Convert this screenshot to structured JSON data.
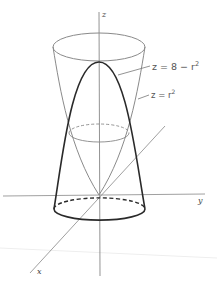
{
  "diagram": {
    "type": "3d-surface-intersection",
    "axes": {
      "z_label": "z",
      "y_label": "y",
      "x_label": "x"
    },
    "surfaces": [
      {
        "name": "paraboloid-downward",
        "equation_lhs": "z = 8 − r",
        "exponent": "2",
        "style": "bold"
      },
      {
        "name": "paraboloid-upward",
        "equation_lhs": "z = r",
        "exponent": "2",
        "style": "thin"
      }
    ],
    "curves": [
      {
        "name": "intersection-circle",
        "style": "dashed-back"
      },
      {
        "name": "base-circle",
        "style": "solid-front-dashed-back"
      },
      {
        "name": "top-rim",
        "style": "solid"
      }
    ],
    "colors": {
      "thin_line": "#8a8a8a",
      "bold_line": "#2a2a2a",
      "axis": "#777777"
    }
  }
}
